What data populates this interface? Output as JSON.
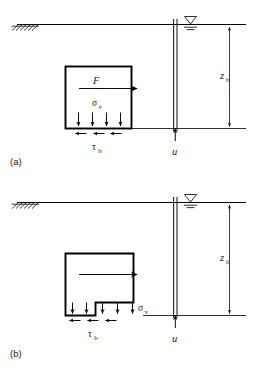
{
  "figure": {
    "background_color": "#ffffff",
    "line_color": "#1a1a1a"
  },
  "panels": [
    {
      "id": "a",
      "label": "(a)",
      "block_shape": "rectangle",
      "labels": {
        "force": "F",
        "vertical_stress": "σ",
        "vertical_stress_sub": "v",
        "shear_stress": "τ",
        "shear_stress_sub": "b",
        "depth": "z",
        "depth_sub": "b",
        "pore_pressure": "u"
      },
      "icons": {
        "ground_hatch": "ground-hatch-icon",
        "water_table": "water-table-icon",
        "force_arrow": "right-arrow-icon",
        "stress_arrows": "down-arrow-icon",
        "shear_arrows": "left-arrow-icon",
        "pore_arrow": "up-arrow-icon",
        "dimension_arrows": "double-arrow-icon"
      },
      "counts": {
        "vertical_stress_arrows": 4,
        "shear_arrows": 3
      }
    },
    {
      "id": "b",
      "label": "(b)",
      "block_shape": "notched-rectangle",
      "labels": {
        "force": "",
        "vertical_stress": "σ",
        "vertical_stress_sub": "v",
        "shear_stress": "τ",
        "shear_stress_sub": "b",
        "depth": "z",
        "depth_sub": "b",
        "pore_pressure": "u"
      },
      "icons": {
        "ground_hatch": "ground-hatch-icon",
        "water_table": "water-table-icon",
        "force_arrow": "right-arrow-icon",
        "stress_arrows": "down-arrow-icon",
        "shear_arrows": "left-arrow-icon",
        "pore_arrow": "up-arrow-icon",
        "dimension_arrows": "double-arrow-icon"
      },
      "counts": {
        "vertical_stress_arrows": 5,
        "shear_arrows": 3
      }
    }
  ]
}
